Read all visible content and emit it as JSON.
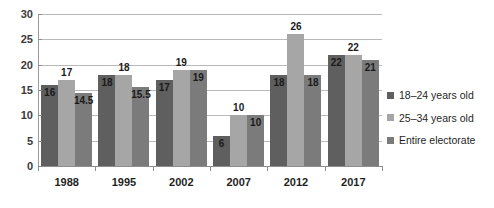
{
  "chart_data": {
    "type": "bar",
    "title": "",
    "subtitle": "",
    "xlabel": "",
    "ylabel": "",
    "ylim": [
      0,
      30
    ],
    "ytick_values": [
      0,
      5,
      10,
      15,
      20,
      25,
      30
    ],
    "ytick_labels": [
      "0",
      "5",
      "10",
      "15",
      "20",
      "25",
      "30"
    ],
    "grid": true,
    "grid_axis": "y",
    "legend_position": "right",
    "categories": [
      "1988",
      "1995",
      "2002",
      "2007",
      "2012",
      "2017"
    ],
    "series": [
      {
        "name": "18–24 years old",
        "color": "#5f5f5f",
        "values": [
          16,
          18,
          17,
          6,
          18,
          22
        ],
        "labels": [
          "16",
          "18",
          "17",
          "6",
          "18",
          "22"
        ]
      },
      {
        "name": "25–34 years old",
        "color": "#a6a6a6",
        "values": [
          17,
          18,
          19,
          10,
          26,
          22
        ],
        "labels": [
          "17",
          "18",
          "19",
          "10",
          "26",
          "22"
        ]
      },
      {
        "name": "Entire electorate",
        "color": "#7b7b7b",
        "values": [
          14.5,
          15.5,
          19,
          10,
          18,
          21
        ],
        "labels": [
          "14.5",
          "15.5",
          "19",
          "10",
          "18",
          "21"
        ]
      }
    ]
  },
  "legend": {
    "items": [
      {
        "label": "18–24 years old",
        "color": "#5f5f5f"
      },
      {
        "label": "25–34 years old",
        "color": "#a6a6a6"
      },
      {
        "label": "Entire electorate",
        "color": "#7b7b7b"
      }
    ]
  }
}
